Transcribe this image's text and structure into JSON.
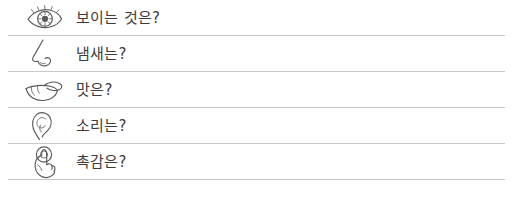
{
  "list": {
    "rows": [
      {
        "icon": "eye-icon",
        "label": "보이는 것은?"
      },
      {
        "icon": "nose-icon",
        "label": "냄새는?"
      },
      {
        "icon": "mouth-tongue-icon",
        "label": "맛은?"
      },
      {
        "icon": "ear-icon",
        "label": "소리는?"
      },
      {
        "icon": "hand-touch-icon",
        "label": "촉감은?"
      }
    ]
  },
  "colors": {
    "background": "#ffffff",
    "divider": "#c9c9c9",
    "text": "#3c3c3c",
    "icon_stroke": "#5a5a5a"
  }
}
